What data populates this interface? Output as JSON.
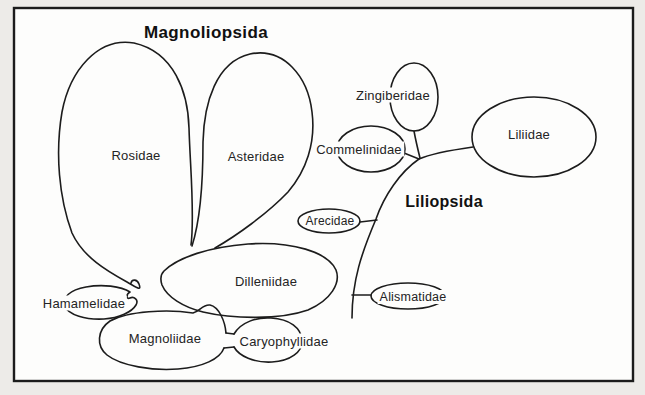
{
  "colors": {
    "background": "#edebe8",
    "paper": "#fdfdfc",
    "ink": "#1c1c1c"
  },
  "diagram": {
    "type": "taxonomy-bubble-diagram",
    "groups": [
      {
        "id": "magnoliopsida",
        "title": "Magnoliopsida",
        "subclasses": [
          "Rosidae",
          "Asteridae",
          "Dilleniidae",
          "Hamamelidae",
          "Magnoliidae",
          "Caryophyllidae"
        ]
      },
      {
        "id": "liliopsida",
        "title": "Liliopsida",
        "subclasses": [
          "Zingiberidae",
          "Commelinidae",
          "Liliidae",
          "Arecidae",
          "Alismatidae"
        ]
      }
    ],
    "labels": {
      "rosidae": "Rosidae",
      "asteridae": "Asteridae",
      "dilleniidae": "Dilleniidae",
      "hamamelidae": "Hamamelidae",
      "magnoliidae": "Magnoliidae",
      "caryophyllidae": "Caryophyllidae",
      "zingiberidae": "Zingiberidae",
      "commelinidae": "Commelinidae",
      "liliidae": "Liliidae",
      "arecidae": "Arecidae",
      "alismatidae": "Alismatidae"
    }
  }
}
